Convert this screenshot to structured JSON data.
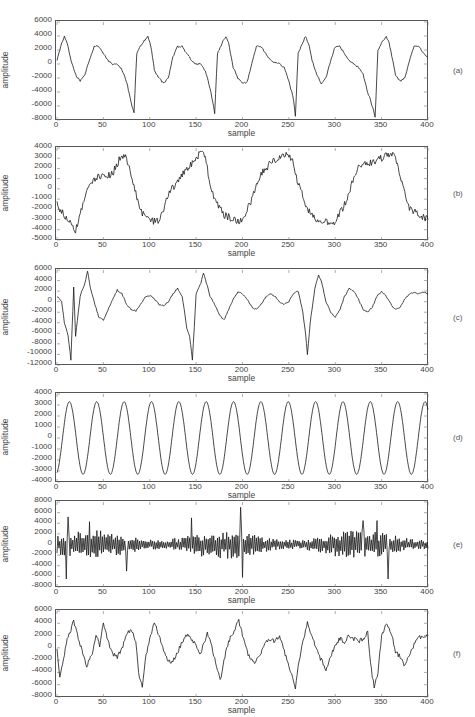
{
  "figure": {
    "x_label": "sample",
    "y_label": "amplitude",
    "x_ticks": [
      0,
      50,
      100,
      150,
      200,
      250,
      300,
      350,
      400
    ]
  },
  "chart_data": [
    {
      "type": "line",
      "panel": "(a)",
      "title": "",
      "xlabel": "sample",
      "ylabel": "amplitude",
      "xlim": [
        0,
        400
      ],
      "ylim": [
        -8000,
        6000
      ],
      "y_ticks": [
        6000,
        4000,
        2000,
        0,
        -2000,
        -4000,
        -6000,
        -8000
      ],
      "description": "Quasi-periodic waveform with period ~87 samples; sharp negative spikes near -7000 at samples ~83, 170, 257, 343; noisy peaks near 4000 after each spike; smooth hump near 2500 mid-cycle.",
      "x": [
        0,
        5,
        8,
        12,
        15,
        20,
        25,
        30,
        35,
        40,
        45,
        50,
        55,
        60,
        65,
        70,
        75,
        80,
        83,
        86,
        90,
        95,
        98,
        102,
        105,
        110,
        115,
        120,
        125,
        130,
        135,
        140,
        145,
        150,
        155,
        160,
        165,
        168,
        170,
        173,
        178,
        182,
        185,
        190,
        195,
        200,
        205,
        210,
        215,
        220,
        225,
        230,
        235,
        240,
        245,
        250,
        255,
        257,
        260,
        265,
        268,
        272,
        275,
        280,
        285,
        290,
        295,
        300,
        305,
        310,
        315,
        320,
        325,
        330,
        335,
        340,
        343,
        346,
        350,
        355,
        358,
        362,
        365,
        370,
        375,
        380,
        385,
        390,
        395,
        400
      ],
      "y": [
        500,
        3000,
        4000,
        2500,
        500,
        -1500,
        -2500,
        -1500,
        500,
        2500,
        2500,
        1500,
        500,
        0,
        0,
        -800,
        -2500,
        -5500,
        -7000,
        1500,
        2500,
        3500,
        4000,
        2000,
        -1000,
        -2000,
        -2800,
        -2000,
        1000,
        2500,
        2500,
        1500,
        500,
        0,
        0,
        -1000,
        -3500,
        -5500,
        -7000,
        1500,
        3000,
        4000,
        3000,
        -500,
        -2000,
        -2800,
        -2500,
        0,
        2500,
        2500,
        1500,
        500,
        200,
        0,
        -500,
        -2500,
        -5000,
        -7500,
        1500,
        3000,
        4000,
        2500,
        500,
        -1500,
        -2800,
        -2000,
        500,
        2500,
        2500,
        1500,
        500,
        0,
        -500,
        -1500,
        -4000,
        -6000,
        -7500,
        2000,
        3000,
        4000,
        3000,
        500,
        -1500,
        -2500,
        -2000,
        500,
        2500,
        2500,
        1500,
        1000
      ]
    },
    {
      "type": "line",
      "panel": "(b)",
      "title": "",
      "xlabel": "sample",
      "ylabel": "amplitude",
      "xlim": [
        0,
        400
      ],
      "ylim": [
        -5000,
        4000
      ],
      "y_ticks": [
        4000,
        3000,
        2000,
        1000,
        0,
        -1000,
        -2000,
        -3000,
        -4000,
        -5000
      ],
      "description": "Slow oscillation (period ~85 samples) between about -3500 and +3500 with dense high-frequency jitter superimposed.",
      "x": [
        0,
        10,
        20,
        25,
        30,
        35,
        40,
        50,
        60,
        65,
        70,
        75,
        80,
        85,
        90,
        95,
        100,
        105,
        110,
        115,
        120,
        130,
        140,
        150,
        155,
        160,
        165,
        170,
        180,
        190,
        195,
        200,
        210,
        220,
        230,
        240,
        245,
        250,
        255,
        260,
        270,
        280,
        290,
        300,
        310,
        320,
        325,
        330,
        340,
        350,
        360,
        365,
        370,
        375,
        380,
        390,
        400
      ],
      "y": [
        -1500,
        -3000,
        -4000,
        -2500,
        -1000,
        500,
        1000,
        1200,
        1500,
        2500,
        3300,
        3000,
        1500,
        -500,
        -2000,
        -2800,
        -3000,
        -3200,
        -3000,
        -2000,
        -500,
        800,
        2000,
        2800,
        3700,
        3000,
        500,
        -1000,
        -2500,
        -3000,
        -3200,
        -3000,
        -1000,
        1500,
        2500,
        3200,
        3400,
        3300,
        2500,
        500,
        -2000,
        -3000,
        -3200,
        -3300,
        -1500,
        1000,
        2000,
        2500,
        2500,
        3000,
        3500,
        3000,
        1500,
        -500,
        -2000,
        -2500,
        -3000,
        -3500,
        -4000,
        -3000,
        -2500,
        -1000,
        500,
        1500,
        1500
      ]
    },
    {
      "type": "line",
      "panel": "(c)",
      "title": "",
      "xlabel": "sample",
      "ylabel": "amplitude",
      "xlim": [
        0,
        400
      ],
      "ylim": [
        -12000,
        6000
      ],
      "y_ticks": [
        6000,
        4000,
        2000,
        0,
        -2000,
        -4000,
        -6000,
        -8000,
        -10000,
        -12000
      ],
      "description": "Mostly smooth low-amplitude oscillation between about -2000 and +2000, with three bursts (around samples 10-35, 140-160, 265-285) containing deep negative spikes to about -10000/-11000 followed by peaks near +5500.",
      "x": [
        0,
        5,
        8,
        12,
        15,
        18,
        20,
        25,
        30,
        33,
        36,
        40,
        45,
        50,
        55,
        60,
        65,
        70,
        75,
        80,
        85,
        90,
        95,
        100,
        105,
        110,
        115,
        120,
        125,
        130,
        135,
        140,
        143,
        146,
        150,
        155,
        158,
        162,
        165,
        170,
        175,
        180,
        185,
        190,
        195,
        200,
        205,
        210,
        215,
        220,
        225,
        230,
        235,
        240,
        245,
        250,
        255,
        260,
        265,
        268,
        270,
        273,
        278,
        282,
        285,
        290,
        295,
        300,
        305,
        310,
        315,
        320,
        325,
        330,
        335,
        340,
        345,
        350,
        355,
        360,
        365,
        370,
        375,
        380,
        385,
        390,
        395,
        400
      ],
      "y": [
        1000,
        0,
        -4000,
        -6500,
        -11000,
        2800,
        -6500,
        1000,
        3500,
        5800,
        2500,
        0,
        -3000,
        -3500,
        -1500,
        500,
        2200,
        1500,
        -500,
        -1500,
        -1800,
        -500,
        800,
        1200,
        500,
        -500,
        -800,
        0,
        1500,
        2500,
        1000,
        -5000,
        -6500,
        -11000,
        1500,
        3500,
        5500,
        3000,
        1000,
        -500,
        -2500,
        -3500,
        -1500,
        500,
        1800,
        1500,
        500,
        -1000,
        -1500,
        -500,
        800,
        1500,
        1000,
        0,
        -500,
        0,
        1500,
        2000,
        -2000,
        -6000,
        -10000,
        -4000,
        2500,
        5000,
        4000,
        0,
        -2000,
        -3000,
        -1500,
        1000,
        2500,
        2000,
        500,
        -1500,
        -2000,
        -1000,
        1000,
        2000,
        1000,
        -500,
        -1500,
        -1000,
        500,
        1500,
        1800,
        1500,
        1800,
        1500
      ]
    },
    {
      "type": "line",
      "panel": "(d)",
      "title": "",
      "xlabel": "sample",
      "ylabel": "amplitude",
      "xlim": [
        0,
        400
      ],
      "ylim": [
        -4000,
        4000
      ],
      "y_ticks": [
        4000,
        3000,
        2000,
        1000,
        0,
        -1000,
        -2000,
        -3000,
        -4000
      ],
      "description": "Clean near-sinusoidal oscillation, amplitude ~3300, period ~29.5 samples (about 13.5 cycles over 400 samples); starts near -3000 at sample 0, first peak at ~15.",
      "function": "y = -3300*cos(2*pi*(x)/29.5 + 0.3)",
      "amplitude": 3300,
      "period": 29.5
    },
    {
      "type": "line",
      "panel": "(e)",
      "title": "",
      "xlabel": "sample",
      "ylabel": "amplitude",
      "xlim": [
        0,
        400
      ],
      "ylim": [
        -8000,
        8000
      ],
      "y_ticks": [
        8000,
        6000,
        4000,
        2000,
        0,
        -2000,
        -4000,
        -6000,
        -8000
      ],
      "description": "Noise-like high-frequency signal mostly within ±3000, with occasional spikes: +5000 at ~12, -6500 at ~10, +5000 at ~145, +7500 at ~198, -6000 at ~200, -6000 at ~357, +4500 at ~345.",
      "spikes": [
        {
          "x": 10,
          "y": -6500
        },
        {
          "x": 12,
          "y": 5200
        },
        {
          "x": 35,
          "y": 4300
        },
        {
          "x": 75,
          "y": -5000
        },
        {
          "x": 145,
          "y": 5000
        },
        {
          "x": 198,
          "y": 7000
        },
        {
          "x": 200,
          "y": -6200
        },
        {
          "x": 330,
          "y": 4500
        },
        {
          "x": 345,
          "y": 4500
        },
        {
          "x": 357,
          "y": -6500
        }
      ],
      "typical_range": [
        -3000,
        3000
      ]
    },
    {
      "type": "line",
      "panel": "(f)",
      "title": "",
      "xlabel": "sample",
      "ylabel": "amplitude",
      "xlim": [
        0,
        400
      ],
      "ylim": [
        -8000,
        6000
      ],
      "y_ticks": [
        6000,
        4000,
        2000,
        0,
        -2000,
        -4000,
        -6000,
        -8000
      ],
      "description": "Irregular oscillation with jitter, typically between -3000 and +4000, with negative dips to about -6500 near samples 90, 175, 257, 340.",
      "x": [
        0,
        3,
        8,
        12,
        15,
        18,
        22,
        28,
        32,
        38,
        42,
        46,
        50,
        55,
        60,
        65,
        70,
        75,
        80,
        85,
        88,
        92,
        95,
        100,
        105,
        108,
        112,
        118,
        122,
        128,
        135,
        140,
        148,
        155,
        162,
        168,
        172,
        176,
        180,
        185,
        192,
        196,
        200,
        206,
        212,
        218,
        222,
        228,
        235,
        240,
        248,
        252,
        257,
        260,
        265,
        270,
        275,
        280,
        285,
        290,
        295,
        300,
        305,
        310,
        315,
        320,
        325,
        330,
        335,
        338,
        342,
        346,
        350,
        355,
        360,
        365,
        370,
        375,
        380,
        385,
        390,
        395,
        400
      ],
      "y": [
        0,
        -5000,
        -1000,
        2000,
        3000,
        4500,
        2000,
        -1000,
        -3000,
        -1000,
        2000,
        500,
        4000,
        1000,
        -1000,
        -1500,
        0,
        2000,
        3200,
        1000,
        -4000,
        -6500,
        -2000,
        1500,
        4000,
        3000,
        1000,
        -1500,
        -2500,
        -1500,
        1000,
        2000,
        1000,
        -1000,
        2500,
        -500,
        -3000,
        -5500,
        -2000,
        1000,
        3000,
        4500,
        2000,
        -1000,
        -2500,
        -1500,
        0,
        1500,
        1000,
        2000,
        -2000,
        -4000,
        -6500,
        -3000,
        1000,
        4000,
        2000,
        -500,
        -2000,
        -3500,
        -1500,
        500,
        1500,
        1000,
        2000,
        1500,
        1000,
        1500,
        2500,
        -2500,
        -6500,
        -4000,
        2000,
        4000,
        2500,
        -500,
        -1500,
        -3000,
        -1000,
        500,
        2000,
        1500,
        2000
      ]
    }
  ],
  "panels": [
    {
      "tag": "(a)",
      "y_ticks": [
        "6000",
        "4000",
        "2000",
        "0",
        "-2000",
        "-4000",
        "-6000",
        "-8000"
      ]
    },
    {
      "tag": "(b)",
      "y_ticks": [
        "4000",
        "3000",
        "2000",
        "1000",
        "0",
        "-1000",
        "-2000",
        "-3000",
        "-4000",
        "-5000"
      ]
    },
    {
      "tag": "(c)",
      "y_ticks": [
        "6000",
        "4000",
        "2000",
        "0",
        "-2000",
        "-4000",
        "-6000",
        "-8000",
        "-10000",
        "-12000"
      ]
    },
    {
      "tag": "(d)",
      "y_ticks": [
        "4000",
        "3000",
        "2000",
        "1000",
        "0",
        "-1000",
        "-2000",
        "-3000",
        "-4000"
      ]
    },
    {
      "tag": "(e)",
      "y_ticks": [
        "8000",
        "6000",
        "4000",
        "2000",
        "0",
        "-2000",
        "-4000",
        "-6000",
        "-8000"
      ]
    },
    {
      "tag": "(f)",
      "y_ticks": [
        "6000",
        "4000",
        "2000",
        "0",
        "-2000",
        "-4000",
        "-6000",
        "-8000"
      ]
    }
  ],
  "style": {
    "line_color": "#1a1a1a",
    "axis_color": "#555555",
    "text_color": "#444444",
    "background": "#ffffff"
  }
}
